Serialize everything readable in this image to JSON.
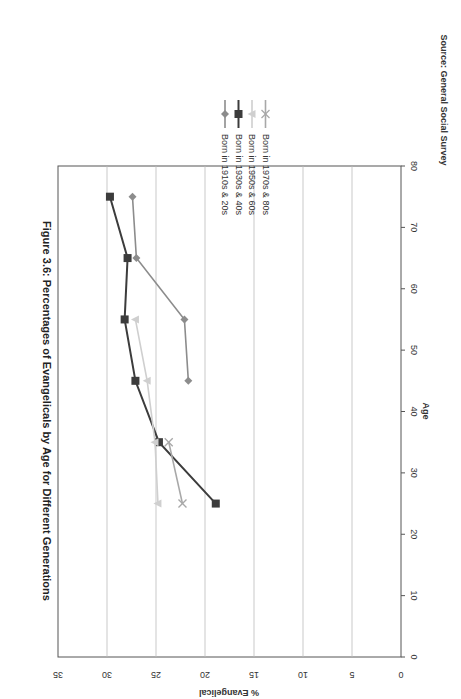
{
  "chart_data": {
    "type": "line",
    "title": "Figure 3.6: Percentages of Evangelicals by Age for Different Generations",
    "xlabel": "Age",
    "ylabel": "% Evangelical",
    "xlim": [
      0,
      80
    ],
    "ylim": [
      0,
      35
    ],
    "xticks": [
      0,
      10,
      20,
      30,
      40,
      50,
      60,
      70,
      80
    ],
    "yticks": [
      0,
      5,
      10,
      15,
      20,
      25,
      30,
      35
    ],
    "grid": "horizontal",
    "orientation": "rotated 90 degrees clockwise on page",
    "legend_position": "right",
    "source": "Source: General Social Survey",
    "series": [
      {
        "name": "Born in 1910s & 20s",
        "marker": "diamond",
        "color": "#8c8c8c",
        "x": [
          45,
          55,
          65,
          75
        ],
        "y": [
          21.7,
          22.1,
          27.0,
          27.4
        ]
      },
      {
        "name": "Born in 1930s & 40s",
        "marker": "square",
        "color": "#3c3c3c",
        "x": [
          25,
          35,
          45,
          55,
          65,
          75
        ],
        "y": [
          18.9,
          24.7,
          27.1,
          28.2,
          27.9,
          29.7
        ]
      },
      {
        "name": "Born in 1950s & 60s",
        "marker": "triangle",
        "color": "#cfcfcf",
        "x": [
          25,
          35,
          45,
          55
        ],
        "y": [
          24.8,
          25.1,
          25.9,
          27.1
        ]
      },
      {
        "name": "Born in 1970s & 80s",
        "marker": "x",
        "color": "#a8a8a8",
        "x": [
          25,
          35
        ],
        "y": [
          22.3,
          23.7
        ]
      }
    ]
  }
}
